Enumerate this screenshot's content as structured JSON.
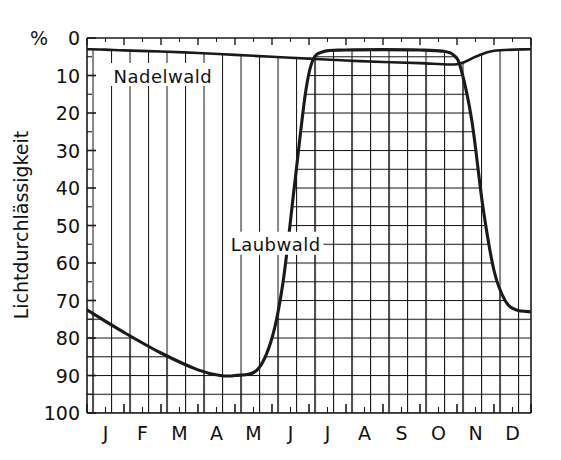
{
  "chart_data": {
    "type": "area",
    "title": "",
    "subtitle": "",
    "xlabel": "",
    "ylabel": "Lichtdurchlässigkeit",
    "yunit": "%",
    "y_axis_inverted": true,
    "ylim": [
      0,
      100
    ],
    "y_ticks": [
      0,
      10,
      20,
      30,
      40,
      50,
      60,
      70,
      80,
      90,
      100
    ],
    "y_minor_step": 5,
    "grid": true,
    "legend_position": "inline-annotation",
    "categories": [
      "J",
      "F",
      "M",
      "A",
      "M",
      "J",
      "J",
      "A",
      "S",
      "O",
      "N",
      "D"
    ],
    "x_tick_labels": [
      "J",
      "F",
      "M",
      "A",
      "M",
      "J",
      "J",
      "A",
      "S",
      "O",
      "N",
      "D"
    ],
    "annotations": [
      {
        "text": "Nadelwald",
        "x_month": "F",
        "y_value": 10
      },
      {
        "text": "Laubwald",
        "x_month": "A",
        "y_value": 55
      }
    ],
    "series": [
      {
        "name": "Nadelwald",
        "fill_pattern": "vertical-hatch",
        "points": [
          {
            "x": 0.0,
            "y": 3.0
          },
          {
            "x": 0.5,
            "y": 3.1
          },
          {
            "x": 1.0,
            "y": 3.3
          },
          {
            "x": 2.0,
            "y": 3.6
          },
          {
            "x": 3.0,
            "y": 4.0
          },
          {
            "x": 4.0,
            "y": 4.5
          },
          {
            "x": 5.0,
            "y": 5.0
          },
          {
            "x": 6.0,
            "y": 5.5
          },
          {
            "x": 7.0,
            "y": 6.0
          },
          {
            "x": 8.0,
            "y": 6.4
          },
          {
            "x": 9.0,
            "y": 6.7
          },
          {
            "x": 10.0,
            "y": 7.0
          },
          {
            "x": 10.5,
            "y": 5.0
          },
          {
            "x": 11.0,
            "y": 3.4
          },
          {
            "x": 12.0,
            "y": 3.0
          }
        ]
      },
      {
        "name": "Laubwald",
        "fill_pattern": "grid-hatch",
        "points": [
          {
            "x": 0.0,
            "y": 72.5
          },
          {
            "x": 1.0,
            "y": 78.5
          },
          {
            "x": 2.0,
            "y": 84.0
          },
          {
            "x": 3.0,
            "y": 88.5
          },
          {
            "x": 3.6,
            "y": 90.0
          },
          {
            "x": 4.0,
            "y": 90.0
          },
          {
            "x": 4.6,
            "y": 88.5
          },
          {
            "x": 5.0,
            "y": 80.0
          },
          {
            "x": 5.3,
            "y": 65.0
          },
          {
            "x": 5.6,
            "y": 40.0
          },
          {
            "x": 5.9,
            "y": 15.0
          },
          {
            "x": 6.1,
            "y": 6.0
          },
          {
            "x": 6.4,
            "y": 3.6
          },
          {
            "x": 7.0,
            "y": 3.2
          },
          {
            "x": 8.0,
            "y": 3.1
          },
          {
            "x": 9.0,
            "y": 3.2
          },
          {
            "x": 9.6,
            "y": 3.5
          },
          {
            "x": 9.9,
            "y": 4.5
          },
          {
            "x": 10.1,
            "y": 8.0
          },
          {
            "x": 10.4,
            "y": 22.0
          },
          {
            "x": 10.7,
            "y": 45.0
          },
          {
            "x": 11.0,
            "y": 62.0
          },
          {
            "x": 11.3,
            "y": 70.0
          },
          {
            "x": 11.6,
            "y": 72.5
          },
          {
            "x": 12.0,
            "y": 73.0
          }
        ]
      }
    ]
  },
  "axis": {
    "percent_symbol": "%",
    "y_title": "Lichtdurchlässigkeit"
  }
}
